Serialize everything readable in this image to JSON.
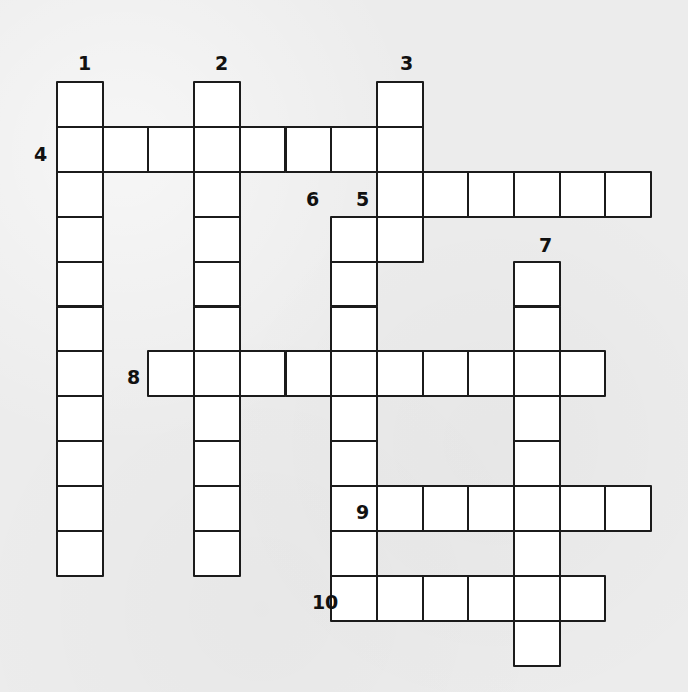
{
  "puzzle": {
    "type": "crossword-grid",
    "title": "",
    "grid": {
      "origin_x": 56,
      "origin_y": 81,
      "cell_width": 45.7,
      "cell_height": 44.9,
      "columns": 14,
      "rows": 13,
      "cell_fill": "#ffffff",
      "cell_border": "#1b1b1b",
      "background": "#ececec"
    },
    "entries": [
      {
        "number": "1",
        "direction": "down",
        "col": 0,
        "row": 0,
        "length": 11
      },
      {
        "number": "2",
        "direction": "down",
        "col": 3,
        "row": 0,
        "length": 11
      },
      {
        "number": "3",
        "direction": "down",
        "col": 7,
        "row": 0,
        "length": 4
      },
      {
        "number": "4",
        "direction": "across",
        "col": 0,
        "row": 1,
        "length": 8
      },
      {
        "number": "5",
        "direction": "across",
        "col": 7,
        "row": 2,
        "length": 6
      },
      {
        "number": "6",
        "direction": "down",
        "col": 6,
        "row": 3,
        "length": 8
      },
      {
        "number": "7",
        "direction": "down",
        "col": 10,
        "row": 4,
        "length": 9
      },
      {
        "number": "8",
        "direction": "across",
        "col": 2,
        "row": 6,
        "length": 10
      },
      {
        "number": "9",
        "direction": "across",
        "col": 7,
        "row": 9,
        "length": 6
      },
      {
        "number": "10",
        "direction": "across",
        "col": 6,
        "row": 11,
        "length": 6
      }
    ],
    "labels": [
      {
        "number": "1",
        "x": 78,
        "y": 54
      },
      {
        "number": "2",
        "x": 215,
        "y": 54
      },
      {
        "number": "3",
        "x": 400,
        "y": 54
      },
      {
        "number": "4",
        "x": 34,
        "y": 145
      },
      {
        "number": "5",
        "x": 356,
        "y": 190
      },
      {
        "number": "6",
        "x": 306,
        "y": 190
      },
      {
        "number": "7",
        "x": 539,
        "y": 236
      },
      {
        "number": "8",
        "x": 127,
        "y": 368
      },
      {
        "number": "9",
        "x": 356,
        "y": 503
      },
      {
        "number": "10",
        "x": 312,
        "y": 593
      }
    ]
  }
}
